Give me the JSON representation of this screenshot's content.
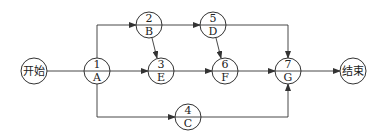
{
  "diagram": {
    "type": "activity-on-node network",
    "start": {
      "label": "开始",
      "cx": 34,
      "cy": 71
    },
    "end": {
      "label": "结束",
      "cx": 353,
      "cy": 71
    },
    "nodes": [
      {
        "id": "1",
        "num": "1",
        "name": "A",
        "cx": 97,
        "cy": 71
      },
      {
        "id": "2",
        "num": "2",
        "name": "B",
        "cx": 149,
        "cy": 25
      },
      {
        "id": "3",
        "num": "3",
        "name": "E",
        "cx": 161,
        "cy": 71
      },
      {
        "id": "4",
        "num": "4",
        "name": "C",
        "cx": 188,
        "cy": 117
      },
      {
        "id": "5",
        "num": "5",
        "name": "D",
        "cx": 213,
        "cy": 25
      },
      {
        "id": "6",
        "num": "6",
        "name": "F",
        "cx": 225,
        "cy": 71
      },
      {
        "id": "7",
        "num": "7",
        "name": "G",
        "cx": 288,
        "cy": 71
      }
    ],
    "edges": [
      {
        "from": "start",
        "to": "1"
      },
      {
        "from": "1",
        "to": "2"
      },
      {
        "from": "1",
        "to": "3"
      },
      {
        "from": "1",
        "to": "4"
      },
      {
        "from": "2",
        "to": "5"
      },
      {
        "from": "2",
        "to": "3"
      },
      {
        "from": "3",
        "to": "6"
      },
      {
        "from": "5",
        "to": "6"
      },
      {
        "from": "5",
        "to": "7"
      },
      {
        "from": "6",
        "to": "7"
      },
      {
        "from": "4",
        "to": "7"
      },
      {
        "from": "7",
        "to": "end"
      }
    ],
    "colors": {
      "stroke": "#333333",
      "text": "#222222",
      "background": "#ffffff"
    }
  }
}
